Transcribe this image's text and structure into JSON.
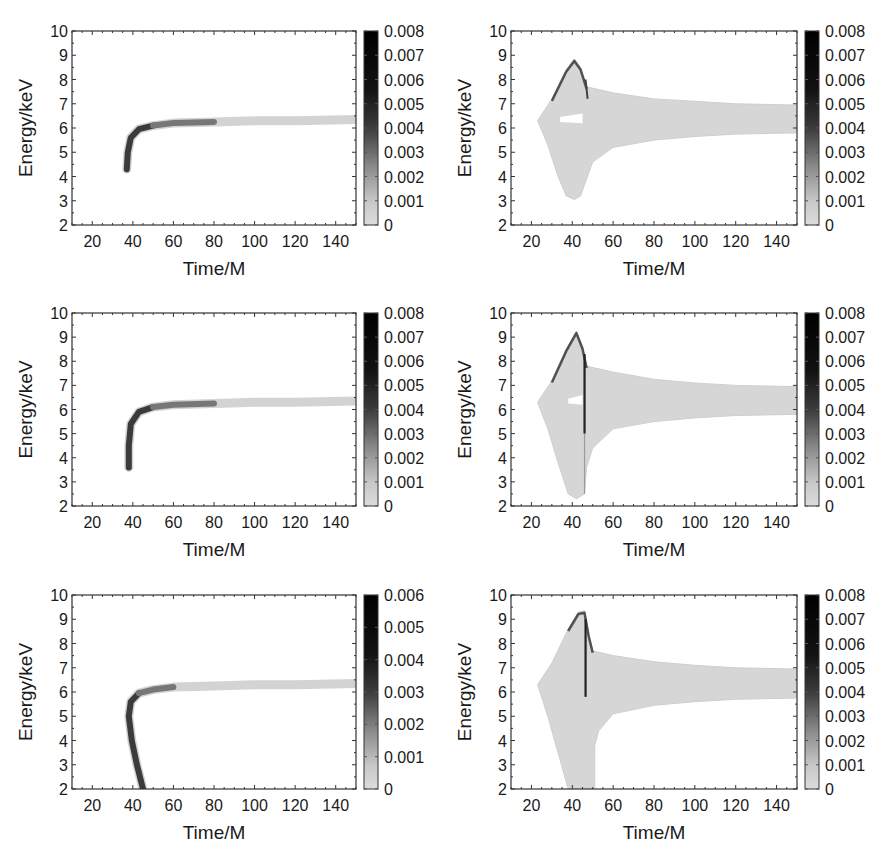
{
  "figure": {
    "layout": {
      "rows": 3,
      "cols": 2
    },
    "colors": {
      "axis": "#333333",
      "envelope": "#d6d6d6",
      "streak_dark": "#111111",
      "background": "#ffffff"
    }
  },
  "chart_data": [
    {
      "id": "row1-left",
      "type": "heatmap",
      "xlabel": "Time/M",
      "ylabel": "Energy/keV",
      "xlim": [
        10,
        150
      ],
      "ylim": [
        2,
        10
      ],
      "xticks": [
        20,
        40,
        60,
        80,
        100,
        120,
        140
      ],
      "yticks": [
        2,
        3,
        4,
        5,
        6,
        7,
        8,
        9,
        10
      ],
      "colorbar": {
        "range": [
          0,
          0.008
        ],
        "ticks": [
          "0",
          "0.001",
          "0.002",
          "0.003",
          "0.004",
          "0.005",
          "0.006",
          "0.007",
          "0.008"
        ]
      },
      "description": "Narrow curved track starting near t=37M, E~4.3 keV (dark, intensity ~0.006-0.008) rising to ~6.2 keV by t~60M, then nearly flat at ~6.3 keV to t=150M (faint)",
      "ridge": [
        [
          37,
          4.3
        ],
        [
          37.5,
          5.0
        ],
        [
          39,
          5.6
        ],
        [
          43,
          5.95
        ],
        [
          50,
          6.1
        ],
        [
          60,
          6.2
        ],
        [
          80,
          6.25
        ],
        [
          100,
          6.3
        ],
        [
          120,
          6.3
        ],
        [
          150,
          6.35
        ]
      ]
    },
    {
      "id": "row1-right",
      "type": "heatmap",
      "xlabel": "Time/M",
      "ylabel": "Energy/keV",
      "xlim": [
        10,
        150
      ],
      "ylim": [
        2,
        10
      ],
      "xticks": [
        20,
        40,
        60,
        80,
        100,
        120,
        140
      ],
      "yticks": [
        2,
        3,
        4,
        5,
        6,
        7,
        8,
        9,
        10
      ],
      "colorbar": {
        "range": [
          0,
          0.008
        ],
        "ticks": [
          "0",
          "0.001",
          "0.002",
          "0.003",
          "0.004",
          "0.005",
          "0.006",
          "0.007",
          "0.008"
        ]
      },
      "description": "Broad faint envelope from t~23M (E~6.3) widening to E 3.1-8.8 keV near t~40M; peak ~8.8 keV at t~41M with dark edge; narrows to 5.8-7.0 keV at t=150M; small white gap near t 33-46, E~6.3",
      "envelope_upper": [
        [
          23,
          6.3
        ],
        [
          30,
          7.2
        ],
        [
          37,
          8.4
        ],
        [
          41,
          8.85
        ],
        [
          44,
          8.5
        ],
        [
          47,
          7.7
        ],
        [
          60,
          7.45
        ],
        [
          80,
          7.2
        ],
        [
          100,
          7.1
        ],
        [
          120,
          7.0
        ],
        [
          150,
          6.95
        ]
      ],
      "envelope_lower": [
        [
          150,
          5.8
        ],
        [
          120,
          5.75
        ],
        [
          100,
          5.65
        ],
        [
          80,
          5.5
        ],
        [
          60,
          5.2
        ],
        [
          50,
          4.6
        ],
        [
          47,
          3.9
        ],
        [
          44,
          3.2
        ],
        [
          41,
          3.05
        ],
        [
          37,
          3.2
        ],
        [
          33,
          4.0
        ],
        [
          28,
          5.3
        ],
        [
          23,
          6.3
        ]
      ]
    },
    {
      "id": "row2-left",
      "type": "heatmap",
      "xlabel": "Time/M",
      "ylabel": "Energy/keV",
      "xlim": [
        10,
        150
      ],
      "ylim": [
        2,
        10
      ],
      "xticks": [
        20,
        40,
        60,
        80,
        100,
        120,
        140
      ],
      "yticks": [
        2,
        3,
        4,
        5,
        6,
        7,
        8,
        9,
        10
      ],
      "colorbar": {
        "range": [
          0,
          0.008
        ],
        "ticks": [
          "0",
          "0.001",
          "0.002",
          "0.003",
          "0.004",
          "0.005",
          "0.006",
          "0.007",
          "0.008"
        ]
      },
      "description": "Track starting near t=38M, E~3.6 keV, rising to ~6.2 keV and flattening to ~6.35 keV by t=150M",
      "ridge": [
        [
          38,
          3.6
        ],
        [
          38,
          4.5
        ],
        [
          39,
          5.4
        ],
        [
          43,
          5.9
        ],
        [
          50,
          6.1
        ],
        [
          60,
          6.2
        ],
        [
          80,
          6.25
        ],
        [
          100,
          6.3
        ],
        [
          120,
          6.3
        ],
        [
          150,
          6.35
        ]
      ]
    },
    {
      "id": "row2-right",
      "type": "heatmap",
      "xlabel": "Time/M",
      "ylabel": "Energy/keV",
      "xlim": [
        10,
        150
      ],
      "ylim": [
        2,
        10
      ],
      "xticks": [
        20,
        40,
        60,
        80,
        100,
        120,
        140
      ],
      "yticks": [
        2,
        3,
        4,
        5,
        6,
        7,
        8,
        9,
        10
      ],
      "colorbar": {
        "range": [
          0,
          0.008
        ],
        "ticks": [
          "0",
          "0.001",
          "0.002",
          "0.003",
          "0.004",
          "0.005",
          "0.006",
          "0.007",
          "0.008"
        ]
      },
      "description": "Broad envelope, peak ~9.2 keV at t~42M with dark edge and dark vertical streak at t~46M from 8 down to 5 keV; lower edge reaches ~2.3 keV at t~42M; white gap at t 38-45, E~6.3",
      "envelope_upper": [
        [
          23,
          6.3
        ],
        [
          30,
          7.2
        ],
        [
          37,
          8.5
        ],
        [
          42,
          9.25
        ],
        [
          45,
          8.6
        ],
        [
          47,
          7.8
        ],
        [
          60,
          7.55
        ],
        [
          80,
          7.25
        ],
        [
          100,
          7.1
        ],
        [
          120,
          7.0
        ],
        [
          150,
          6.95
        ]
      ],
      "envelope_lower": [
        [
          150,
          5.8
        ],
        [
          120,
          5.75
        ],
        [
          100,
          5.65
        ],
        [
          80,
          5.5
        ],
        [
          60,
          5.2
        ],
        [
          50,
          4.4
        ],
        [
          47,
          3.6
        ],
        [
          46,
          2.5
        ],
        [
          42,
          2.3
        ],
        [
          38,
          2.5
        ],
        [
          33,
          3.8
        ],
        [
          28,
          5.2
        ],
        [
          23,
          6.3
        ]
      ]
    },
    {
      "id": "row3-left",
      "type": "heatmap",
      "xlabel": "Time/M",
      "ylabel": "Energy/keV",
      "xlim": [
        10,
        150
      ],
      "ylim": [
        2,
        10
      ],
      "xticks": [
        20,
        40,
        60,
        80,
        100,
        120,
        140
      ],
      "yticks": [
        2,
        3,
        4,
        5,
        6,
        7,
        8,
        9,
        10
      ],
      "colorbar": {
        "range": [
          0,
          0.006
        ],
        "ticks": [
          "0",
          "0.001",
          "0.002",
          "0.003",
          "0.004",
          "0.005",
          "0.006"
        ]
      },
      "description": "Track descending from E=2 keV at t~45M up to ~5.5 keV at t~37M (dark), bending to ~6.2 keV by t~60M, flat at ~6.35 keV to t=150M",
      "ridge": [
        [
          45,
          2.0
        ],
        [
          42,
          3.0
        ],
        [
          39.5,
          4.0
        ],
        [
          38,
          5.0
        ],
        [
          39,
          5.6
        ],
        [
          43,
          5.95
        ],
        [
          50,
          6.1
        ],
        [
          60,
          6.2
        ],
        [
          80,
          6.25
        ],
        [
          100,
          6.3
        ],
        [
          120,
          6.3
        ],
        [
          150,
          6.35
        ]
      ]
    },
    {
      "id": "row3-right",
      "type": "heatmap",
      "xlabel": "Time/M",
      "ylabel": "Energy/keV",
      "xlim": [
        10,
        150
      ],
      "ylim": [
        2,
        10
      ],
      "xticks": [
        20,
        40,
        60,
        80,
        100,
        120,
        140
      ],
      "yticks": [
        2,
        3,
        4,
        5,
        6,
        7,
        8,
        9,
        10
      ],
      "colorbar": {
        "range": [
          0,
          0.008
        ],
        "ticks": [
          "0",
          "0.001",
          "0.002",
          "0.003",
          "0.004",
          "0.005",
          "0.006",
          "0.007",
          "0.008"
        ]
      },
      "description": "Broad envelope extending below 2 keV between t~38-51M; peak ~9.35 keV at t~45M, dark cap and dark vertical streak at t~46-47M from 9 to ~5.8 keV; narrows to 5.8-7.0 keV at t=150M",
      "envelope_upper": [
        [
          23,
          6.3
        ],
        [
          30,
          7.2
        ],
        [
          38,
          8.6
        ],
        [
          43,
          9.3
        ],
        [
          46,
          9.35
        ],
        [
          48,
          8.4
        ],
        [
          50,
          7.7
        ],
        [
          60,
          7.5
        ],
        [
          80,
          7.25
        ],
        [
          100,
          7.1
        ],
        [
          120,
          7.0
        ],
        [
          150,
          6.95
        ]
      ],
      "envelope_lower": [
        [
          150,
          5.75
        ],
        [
          120,
          5.7
        ],
        [
          100,
          5.6
        ],
        [
          80,
          5.45
        ],
        [
          60,
          5.1
        ],
        [
          53,
          4.4
        ],
        [
          51,
          3.8
        ],
        [
          51,
          2.0
        ],
        [
          38,
          2.0
        ],
        [
          33,
          3.5
        ],
        [
          28,
          5.0
        ],
        [
          23,
          6.3
        ]
      ]
    }
  ]
}
